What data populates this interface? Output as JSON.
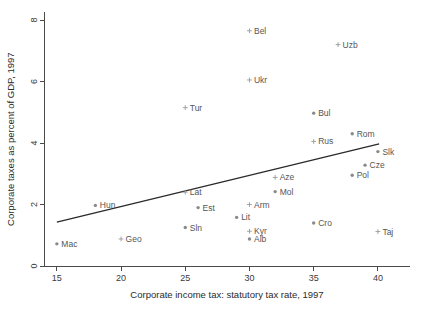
{
  "chart_data": {
    "type": "scatter",
    "title": "",
    "xlabel": "Corporate income tax: statutory tax rate, 1997",
    "ylabel": "Corporate taxes as percent of GDP, 1997",
    "xlim": [
      14.0,
      42.5
    ],
    "ylim": [
      0,
      8.25
    ],
    "xticks": [
      15,
      20,
      25,
      30,
      35,
      40
    ],
    "xticklabels": [
      "15",
      "20",
      "25",
      "30",
      "35",
      "40"
    ],
    "yticks": [
      0,
      2,
      4,
      6,
      8
    ],
    "yticklabels": [
      "0",
      "2",
      "4",
      "6",
      "8"
    ],
    "grid": false,
    "legend": "none",
    "marker_styles": [
      "dot",
      "plus"
    ],
    "points": [
      {
        "label": "Bel",
        "x": 30.0,
        "y": 7.65,
        "marker": "plus",
        "label_side": "right"
      },
      {
        "label": "Uzb",
        "x": 36.9,
        "y": 7.2,
        "marker": "plus",
        "label_side": "right"
      },
      {
        "label": "Ukr",
        "x": 30.0,
        "y": 6.05,
        "marker": "plus",
        "label_side": "right"
      },
      {
        "label": "Tur",
        "x": 25.0,
        "y": 5.15,
        "marker": "plus",
        "label_side": "right"
      },
      {
        "label": "Bul",
        "x": 35.0,
        "y": 4.97,
        "marker": "dot",
        "label_side": "right"
      },
      {
        "label": "Rom",
        "x": 38.0,
        "y": 4.3,
        "marker": "dot",
        "label_side": "right"
      },
      {
        "label": "Rus",
        "x": 35.0,
        "y": 4.05,
        "marker": "plus",
        "label_side": "right"
      },
      {
        "label": "Slk",
        "x": 40.0,
        "y": 3.72,
        "marker": "dot",
        "label_side": "right"
      },
      {
        "label": "Cze",
        "x": 39.0,
        "y": 3.28,
        "marker": "dot",
        "label_side": "right"
      },
      {
        "label": "Pol",
        "x": 38.0,
        "y": 2.95,
        "marker": "dot",
        "label_side": "right"
      },
      {
        "label": "Aze",
        "x": 32.0,
        "y": 2.88,
        "marker": "plus",
        "label_side": "right"
      },
      {
        "label": "Mol",
        "x": 32.0,
        "y": 2.42,
        "marker": "dot",
        "label_side": "right"
      },
      {
        "label": "Lat",
        "x": 25.0,
        "y": 2.4,
        "marker": "plus",
        "label_side": "right"
      },
      {
        "label": "Arm",
        "x": 30.0,
        "y": 2.0,
        "marker": "plus",
        "label_side": "right"
      },
      {
        "label": "Hun",
        "x": 18.0,
        "y": 1.97,
        "marker": "dot",
        "label_side": "right"
      },
      {
        "label": "Est",
        "x": 26.0,
        "y": 1.9,
        "marker": "dot",
        "label_side": "right"
      },
      {
        "label": "Lit",
        "x": 29.0,
        "y": 1.58,
        "marker": "dot",
        "label_side": "right"
      },
      {
        "label": "Cro",
        "x": 35.0,
        "y": 1.4,
        "marker": "dot",
        "label_side": "right"
      },
      {
        "label": "Sln",
        "x": 25.0,
        "y": 1.25,
        "marker": "dot",
        "label_side": "right"
      },
      {
        "label": "Kyr",
        "x": 30.0,
        "y": 1.13,
        "marker": "plus",
        "label_side": "right"
      },
      {
        "label": "Taj",
        "x": 40.0,
        "y": 1.12,
        "marker": "plus",
        "label_side": "right"
      },
      {
        "label": "Alb",
        "x": 30.0,
        "y": 0.88,
        "marker": "dot",
        "label_side": "right"
      },
      {
        "label": "Geo",
        "x": 20.0,
        "y": 0.88,
        "marker": "plus",
        "label_side": "right"
      },
      {
        "label": "Mac",
        "x": 15.0,
        "y": 0.72,
        "marker": "dot",
        "label_side": "right"
      }
    ],
    "fit_line": {
      "name": "linear-fit",
      "x_start": 15.0,
      "y_start": 1.43,
      "x_end": 40.1,
      "y_end": 3.97
    }
  }
}
